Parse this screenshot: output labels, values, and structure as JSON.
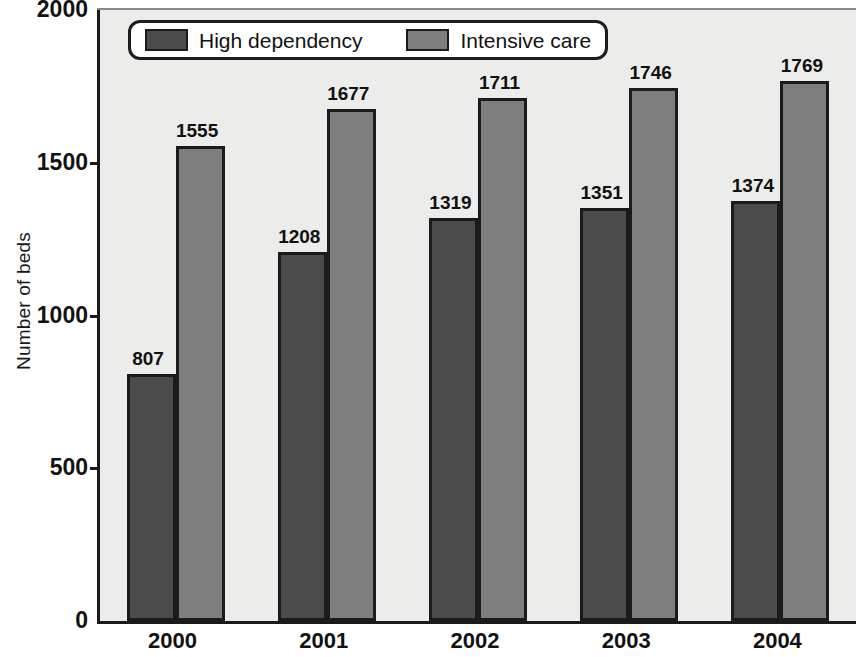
{
  "chart_data": {
    "type": "bar",
    "title": "",
    "xlabel": "",
    "ylabel": "Number of beds",
    "categories": [
      "2000",
      "2001",
      "2002",
      "2003",
      "2004"
    ],
    "series": [
      {
        "name": "High dependency",
        "color": "#4b4b4b",
        "values": [
          807,
          1208,
          1319,
          1351,
          1374
        ]
      },
      {
        "name": "Intensive care",
        "color": "#7e7e7e",
        "values": [
          1555,
          1677,
          1711,
          1746,
          1769
        ]
      }
    ],
    "ylim": [
      0,
      2000
    ],
    "yticks": [
      0,
      500,
      1000,
      1500,
      2000
    ],
    "ytick_labels": [
      "0",
      "500",
      "1000",
      "1500",
      "2000"
    ],
    "grid": false,
    "legend_position": "top-left",
    "data_labels": true,
    "plot_background": "#ececea",
    "axis_color": "#1a1a1a"
  },
  "legend": {
    "items": [
      {
        "label": "High dependency"
      },
      {
        "label": "Intensive care"
      }
    ]
  }
}
